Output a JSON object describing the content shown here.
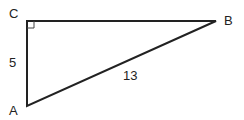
{
  "diagram": {
    "type": "right-triangle",
    "vertices": {
      "A": {
        "label": "A"
      },
      "B": {
        "label": "B"
      },
      "C": {
        "label": "C"
      }
    },
    "right_angle_at": "C",
    "sides": {
      "AC": {
        "label": "5"
      },
      "AB": {
        "label": "13"
      }
    },
    "colors": {
      "stroke": "#222222",
      "background": "#ffffff"
    }
  }
}
